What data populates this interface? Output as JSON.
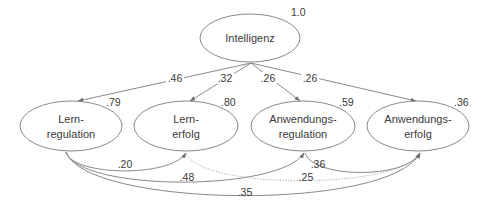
{
  "diagram": {
    "type": "path-model",
    "nodes": {
      "intelligenz": {
        "line1": "Intelligenz",
        "line2": "",
        "r2": "1.0"
      },
      "lernregulation": {
        "line1": "Lern-",
        "line2": "regulation",
        "r2": ".79"
      },
      "lernerfolg": {
        "line1": "Lern-",
        "line2": "erfolg",
        "r2": ".80"
      },
      "anwendungsregulation": {
        "line1": "Anwendungs-",
        "line2": "regulation",
        "r2": ".59"
      },
      "anwendungserfolg": {
        "line1": "Anwendungs-",
        "line2": "erfolg",
        "r2": ".36"
      }
    },
    "edges": {
      "intelligenz_lernregulation": {
        "from": "Intelligenz",
        "to": "Lernregulation",
        "coef": ".46",
        "style": "solid"
      },
      "intelligenz_lernerfolg": {
        "from": "Intelligenz",
        "to": "Lernerfolg",
        "coef": ".32",
        "style": "solid"
      },
      "intelligenz_anwendungsregulation": {
        "from": "Intelligenz",
        "to": "Anwendungsregulation",
        "coef": ".26",
        "style": "solid"
      },
      "intelligenz_anwendungserfolg": {
        "from": "Intelligenz",
        "to": "Anwendungserfolg",
        "coef": ".26",
        "style": "solid"
      },
      "lernregulation_lernerfolg": {
        "from": "Lernregulation",
        "to": "Lernerfolg",
        "coef": ".20",
        "style": "solid"
      },
      "lernregulation_anwendungsregulation": {
        "from": "Lernregulation",
        "to": "Anwendungsregulation",
        "coef": ".48",
        "style": "solid"
      },
      "lernregulation_anwendungserfolg": {
        "from": "Lernregulation",
        "to": "Anwendungserfolg",
        "coef": ".35",
        "style": "solid"
      },
      "lernerfolg_anwendungserfolg": {
        "from": "Lernerfolg",
        "to": "Anwendungserfolg",
        "coef": ".25",
        "style": "dotted"
      },
      "anwendungsregulation_anwendungserfolg": {
        "from": "Anwendungsregulation",
        "to": "Anwendungserfolg",
        "coef": ".36",
        "style": "solid"
      }
    },
    "colors": {
      "stroke": "#8a8a8a",
      "text": "#3a3a3a",
      "background": "#ffffff"
    }
  }
}
